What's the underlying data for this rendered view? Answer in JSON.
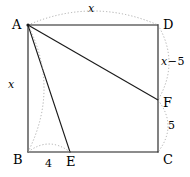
{
  "figure": {
    "type": "geometry-diagram",
    "width": 190,
    "height": 177,
    "stroke_color": "#1a1a1a",
    "arc_color": "#9a9a9a",
    "background": "#ffffff"
  },
  "vertices": [
    {
      "id": "A",
      "label": "A",
      "x": 28,
      "y": 25,
      "label_x": 12,
      "label_y": 18
    },
    {
      "id": "D",
      "label": "D",
      "x": 158,
      "y": 25,
      "label_x": 163,
      "label_y": 18
    },
    {
      "id": "F",
      "label": "F",
      "x": 158,
      "y": 100,
      "label_x": 163,
      "label_y": 96
    },
    {
      "id": "C",
      "label": "C",
      "x": 158,
      "y": 152,
      "label_x": 163,
      "label_y": 153
    },
    {
      "id": "E",
      "label": "E",
      "x": 70,
      "y": 152,
      "label_x": 66,
      "label_y": 155
    },
    {
      "id": "B",
      "label": "B",
      "x": 28,
      "y": 152,
      "label_x": 13,
      "label_y": 153
    }
  ],
  "edges": [
    {
      "name": "side-AD",
      "from": "A",
      "to": "D"
    },
    {
      "name": "side-DC",
      "from": "D",
      "to": "C"
    },
    {
      "name": "side-CB",
      "from": "C",
      "to": "B"
    },
    {
      "name": "side-BA",
      "from": "B",
      "to": "A"
    },
    {
      "name": "segment-AF",
      "from": "A",
      "to": "F"
    },
    {
      "name": "segment-AE",
      "from": "A",
      "to": "E"
    }
  ],
  "measurements": [
    {
      "id": "top",
      "name": "measure-AD",
      "text": "x",
      "parts": [
        {
          "t": "x",
          "k": "var"
        }
      ],
      "label_x": 88,
      "label_y": 3,
      "arc": {
        "x1": 28,
        "y1": 25,
        "x2": 158,
        "y2": 25,
        "bow": -14
      }
    },
    {
      "id": "left",
      "name": "measure-AB",
      "text": "x",
      "parts": [
        {
          "t": "x",
          "k": "var"
        }
      ],
      "label_x": 8,
      "label_y": 79,
      "arc": {
        "x1": 28,
        "y1": 25,
        "x2": 28,
        "y2": 152,
        "bow": -16
      }
    },
    {
      "id": "right-upper",
      "name": "measure-DF",
      "text": "x − 5",
      "parts": [
        {
          "t": "x",
          "k": "var"
        },
        {
          "t": "−",
          "k": "op"
        },
        {
          "t": "5",
          "k": "num"
        }
      ],
      "label_x": 161,
      "label_y": 56,
      "arc": {
        "x1": 158,
        "y1": 25,
        "x2": 158,
        "y2": 100,
        "bow": -11
      }
    },
    {
      "id": "right-lower",
      "name": "measure-FC",
      "text": "5",
      "parts": [
        {
          "t": "5",
          "k": "num"
        }
      ],
      "label_x": 168,
      "label_y": 120,
      "arc": {
        "x1": 158,
        "y1": 100,
        "x2": 158,
        "y2": 152,
        "bow": -10
      }
    },
    {
      "id": "bottom",
      "name": "measure-BE",
      "text": "4",
      "parts": [
        {
          "t": "4",
          "k": "num"
        }
      ],
      "label_x": 45,
      "label_y": 158,
      "arc": {
        "x1": 28,
        "y1": 152,
        "x2": 70,
        "y2": 152,
        "bow": -8
      }
    }
  ]
}
